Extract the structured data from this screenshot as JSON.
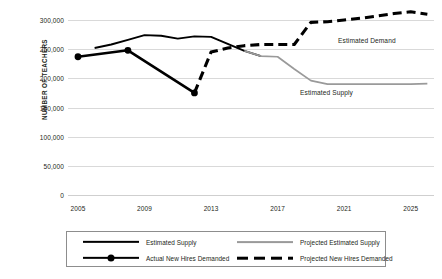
{
  "chart_data": {
    "type": "line",
    "title": "",
    "xlabel": "",
    "ylabel": "NUMBER OF TEACHERS",
    "xlim": [
      2004.4,
      2026.4
    ],
    "ylim": [
      0,
      300000
    ],
    "grid": true,
    "legend_position": "bottom",
    "x_ticks": [
      "2005",
      "2009",
      "2013",
      "2017",
      "2021",
      "2025"
    ],
    "x_tick_values": [
      2005,
      2009,
      2013,
      2017,
      2021,
      2025
    ],
    "y_ticks": [
      "0",
      "50,000",
      "100,000",
      "150,000",
      "200,000",
      "250,000",
      "300,000"
    ],
    "y_tick_values": [
      0,
      50000,
      100000,
      150000,
      200000,
      250000,
      300000
    ],
    "annotations": [
      {
        "text": "Estimated Demand",
        "x": 2021.5,
        "y": 296000
      },
      {
        "text": "Estimated Supply",
        "x": 2019.0,
        "y": 206000
      }
    ],
    "series": [
      {
        "name": "Estimated Supply",
        "style": "solid",
        "color": "#000000",
        "markers": false,
        "x": [
          2006,
          2007,
          2008,
          2009,
          2010,
          2011,
          2012,
          2013,
          2014,
          2015,
          2016
        ],
        "values": [
          252000,
          258000,
          266000,
          274000,
          273000,
          268000,
          272000,
          271000,
          259000,
          247000,
          238000
        ]
      },
      {
        "name": "Actual New Hires Demanded",
        "style": "solid",
        "color": "#000000",
        "markers": true,
        "x": [
          2005,
          2008,
          2012
        ],
        "values": [
          237000,
          248000,
          175000
        ]
      },
      {
        "name": "Projected Estimated Supply",
        "style": "solid",
        "color": "#9a9a9a",
        "markers": false,
        "x": [
          2015,
          2016,
          2017,
          2018,
          2019,
          2020,
          2021,
          2022,
          2023,
          2024,
          2025,
          2026
        ],
        "values": [
          247000,
          238000,
          237000,
          216000,
          196000,
          190000,
          190000,
          190000,
          190000,
          190000,
          190000,
          191000
        ]
      },
      {
        "name": "Projected New Hires Demanded",
        "style": "dashed",
        "color": "#000000",
        "markers": false,
        "x": [
          2012,
          2013,
          2014,
          2015,
          2016,
          2017,
          2018,
          2019,
          2020,
          2021,
          2022,
          2023,
          2024,
          2025,
          2026
        ],
        "values": [
          175000,
          245000,
          252000,
          256000,
          258000,
          258000,
          258000,
          296000,
          297000,
          300000,
          303000,
          307000,
          311000,
          314000,
          310000
        ]
      }
    ]
  },
  "axis": {
    "y_title": "NUMBER OF TEACHERS"
  },
  "annotations": {
    "estimated_demand": "Estimated Demand",
    "estimated_supply": "Estimated Supply"
  },
  "legend": {
    "items": [
      {
        "label": "Estimated Supply",
        "style": "solid-black",
        "marker": false
      },
      {
        "label": "Actual New Hires Demanded",
        "style": "solid-black",
        "marker": true
      },
      {
        "label": "Projected Estimated Supply",
        "style": "solid-gray",
        "marker": false
      },
      {
        "label": "Projected New Hires Demanded",
        "style": "dashed-black",
        "marker": false
      }
    ]
  },
  "top_clip": {
    "text": ""
  },
  "colors": {
    "series_black": "#000000",
    "series_gray": "#9a9a9a",
    "gridline": "#d9d9d9",
    "text": "#231f20",
    "legend_border": "#8d8d8d"
  }
}
